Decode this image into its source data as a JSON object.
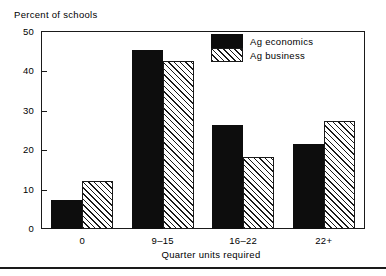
{
  "chart_data": {
    "type": "bar",
    "title": "",
    "xlabel": "Quarter units required",
    "ylabel": "Percent of schools",
    "categories": [
      "0",
      "9–15",
      "16–22",
      "22+"
    ],
    "series": [
      {
        "name": "Ag economics",
        "values": [
          7.3,
          45.5,
          26.4,
          21.7
        ],
        "fill": "solid",
        "color": "#0d0d0d"
      },
      {
        "name": "Ag business",
        "values": [
          12.1,
          42.6,
          18.4,
          27.5
        ],
        "fill": "hatched",
        "color": "#1a1a1a"
      }
    ],
    "ylim": [
      0,
      50
    ],
    "yticks": [
      0,
      10,
      20,
      30,
      40,
      50
    ],
    "ytick_labels": [
      "0",
      "10",
      "20",
      "30",
      "40",
      "50"
    ],
    "grid": false,
    "legend_position": "top-right-inside"
  },
  "axes": {
    "y_title": "Percent of schools",
    "x_title": "Quarter units required"
  },
  "legend": {
    "entries": [
      {
        "label": "Ag economics"
      },
      {
        "label": "Ag business"
      }
    ]
  },
  "colors": {
    "ink": "#1a1a1a",
    "bar_solid": "#0d0d0d",
    "background": "#ffffff"
  }
}
